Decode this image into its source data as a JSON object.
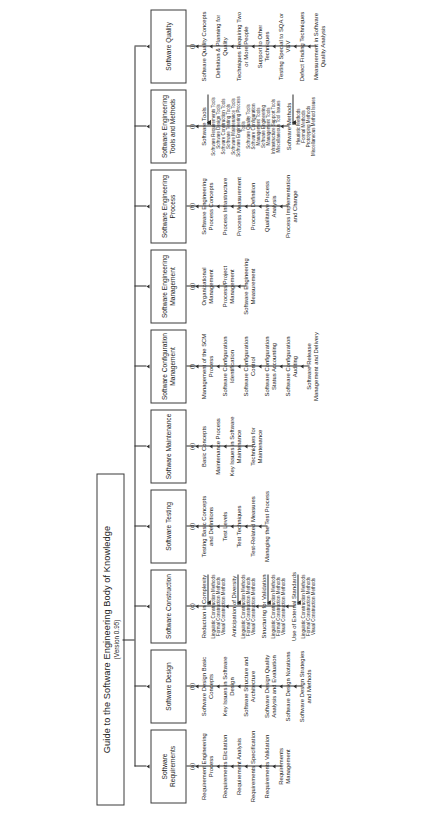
{
  "diagram": {
    "type": "tree",
    "orientation": "rotated-90-ccw",
    "root": {
      "title": "Guide to the Software Engineering Body of Knowledge",
      "version": "(Version 0.95)"
    },
    "knowledge_areas": [
      {
        "tag": "(a)",
        "title": "Software Requirements",
        "topics": [
          {
            "label": "Requirement Engineering Process"
          },
          {
            "label": "Requirements Elicitation"
          },
          {
            "label": "Requirement Analysis"
          },
          {
            "label": "Requirements Specification"
          },
          {
            "label": "Requirements Validation"
          },
          {
            "label": "Requirements Management"
          }
        ]
      },
      {
        "tag": "(b)",
        "title": "Software Design",
        "topics": [
          {
            "label": "Software Design Basic Concepts"
          },
          {
            "label": "Key Issues in Software Design"
          },
          {
            "label": "Software Structure and Architecture"
          },
          {
            "label": "Software Design Quality Analysis and Evaluation"
          },
          {
            "label": "Software Design Notations"
          },
          {
            "label": "Software Design Strategies and Methods"
          }
        ]
      },
      {
        "tag": "(c)",
        "title": "Software Construction",
        "topics": [
          {
            "label": "Reduction in Complexity",
            "children": [
              "Linguistic Construction Methods",
              "Formal Construction Methods",
              "Visual Construction Methods"
            ]
          },
          {
            "label": "Anticipation of Diversity",
            "children": [
              "Linguistic Construction Methods",
              "Formal Construction Methods",
              "Visual Construction Methods"
            ]
          },
          {
            "label": "Structuring for Validation",
            "children": [
              "Linguistic Construction Methods",
              "Formal Construction Methods",
              "Visual Construction Methods"
            ]
          },
          {
            "label": "Use of External Standards",
            "children": [
              "Linguistic Construction Methods",
              "Formal Construction Methods",
              "Visual Construction Methods"
            ]
          }
        ]
      },
      {
        "tag": "(d)",
        "title": "Software Testing",
        "topics": [
          {
            "label": "Testing Basic Concepts and Definitions"
          },
          {
            "label": "Test Levels"
          },
          {
            "label": "Test Techniques"
          },
          {
            "label": "Test-Related Measures"
          },
          {
            "label": "Managing the Test Process"
          }
        ]
      },
      {
        "tag": "(e)",
        "title": "Software Maintenance",
        "topics": [
          {
            "label": "Basic Concepts"
          },
          {
            "label": "Maintenance Process"
          },
          {
            "label": "Key Issues in Software Maintenance"
          },
          {
            "label": "Techniques for Maintenance"
          }
        ]
      },
      {
        "tag": "(f)",
        "title": "Software Configuration Management",
        "topics": [
          {
            "label": "Management of the SCM Process"
          },
          {
            "label": "Software Configuration Identification"
          },
          {
            "label": "Software Configuration Control"
          },
          {
            "label": "Software Configuration Status Accounting"
          },
          {
            "label": "Software Configuration Auditing"
          },
          {
            "label": "Software Release Management and Delivery"
          }
        ]
      },
      {
        "tag": "(g)",
        "title": "Software Engineering Management",
        "topics": [
          {
            "label": "Organizational Management"
          },
          {
            "label": "Process/Project Management"
          },
          {
            "label": "Software Engineering Measurement"
          }
        ]
      },
      {
        "tag": "(h)",
        "title": "Software Engineering Process",
        "topics": [
          {
            "label": "Software Engineering Process Concepts"
          },
          {
            "label": "Process Infrastructure"
          },
          {
            "label": "Process Measurement"
          },
          {
            "label": "Process Definition"
          },
          {
            "label": "Qualitative Process Analysis"
          },
          {
            "label": "Process Implementation and Change"
          }
        ]
      },
      {
        "tag": "(i)",
        "title": "Software Engineering Tools and Methods",
        "topics": [
          {
            "label": "Software Tools",
            "children": [
              "Software Requirements Tools",
              "Software Design Tools",
              "Software Construction Tools",
              "Software Testing Tools",
              "Software Maintenance Tools",
              "Software Engineering Process Tools",
              "Software Quality Tools",
              "Software Configuration Management Tools",
              "Software Engineering Management Tools",
              "Infrastructure Support Tools",
              "Miscellaneous Tool Issues"
            ]
          },
          {
            "label": "Software Methods",
            "children": [
              "Heuristic Methods",
              "Formal Methods",
              "Prototyping Methods",
              "Miscellaneous Method Issues"
            ]
          }
        ]
      },
      {
        "tag": "(j)",
        "title": "Software Quality",
        "topics": [
          {
            "label": "Software Quality Concepts"
          },
          {
            "label": "Definition & Planning for Quality"
          },
          {
            "label": "Techniques Requiring Two or More People"
          },
          {
            "label": "Support to Other Techniques"
          },
          {
            "label": "Testing Special to SQA or V&V"
          },
          {
            "label": "Defect Finding Techniques"
          },
          {
            "label": "Measurement in Software Quality Analysis"
          }
        ]
      }
    ]
  },
  "colors": {
    "line": "#2b2b2b",
    "box_border": "#3a3a3a",
    "background": "#ffffff",
    "text": "#1c1c1c"
  }
}
